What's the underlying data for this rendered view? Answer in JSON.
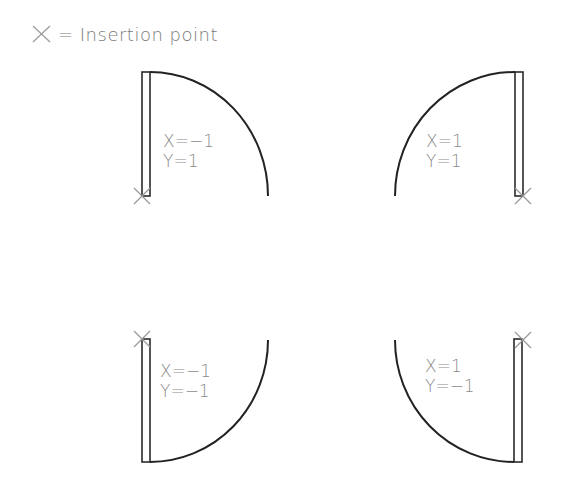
{
  "legend": {
    "symbol": "×",
    "text": "= Insertion point"
  },
  "doors": [
    {
      "id": "top-left",
      "x_label": "X=−1",
      "y_label": "Y=1"
    },
    {
      "id": "top-right",
      "x_label": "X=1",
      "y_label": "Y=1"
    },
    {
      "id": "bottom-left",
      "x_label": "X=−1",
      "y_label": "Y=−1"
    },
    {
      "id": "bottom-right",
      "x_label": "X=1",
      "y_label": "Y=−1"
    }
  ],
  "colors": {
    "line": "#222222",
    "text": "#8a8a8a",
    "insertion_mark": "#9a9a9a"
  }
}
